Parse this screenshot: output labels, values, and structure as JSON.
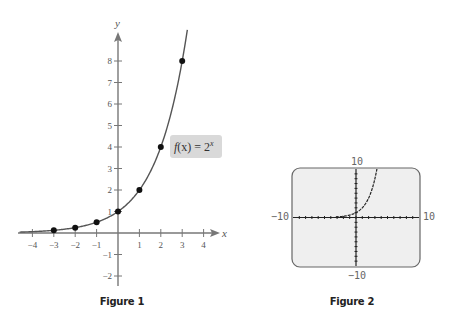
{
  "chart_data": [
    {
      "type": "line",
      "title": "",
      "caption": "Figure 1",
      "function": "2^x",
      "xlabel": "x",
      "ylabel": "y",
      "xlim": [
        -4.5,
        4.6
      ],
      "ylim": [
        -2.4,
        9.3
      ],
      "xticks": [
        -4,
        -3,
        -2,
        -1,
        1,
        2,
        3,
        4
      ],
      "yticks": [
        -2,
        -1,
        1,
        2,
        3,
        4,
        5,
        6,
        7,
        8
      ],
      "xtick_labels": [
        "−4",
        "−3",
        "−2",
        "−1",
        "1",
        "2",
        "3",
        "4"
      ],
      "ytick_labels": [
        "−2",
        "−1",
        "1",
        "2",
        "3",
        "4",
        "5",
        "6",
        "7",
        "8"
      ],
      "points": {
        "x": [
          -3,
          -2,
          -1,
          0,
          1,
          2,
          3
        ],
        "y": [
          0.125,
          0.25,
          0.5,
          1,
          2,
          4,
          8
        ]
      },
      "annotation": {
        "text_f": "f",
        "text_x": "(x) = 2",
        "text_exp": "x",
        "color": "#d9d9d9"
      },
      "grid": false
    },
    {
      "type": "line",
      "title": "",
      "caption": "Figure 2",
      "function": "2^x",
      "window": {
        "xmin": -10,
        "xmax": 10,
        "ymin": -10,
        "ymax": 10
      },
      "labels": {
        "top": "10",
        "bottom": "−10",
        "left": "−10",
        "right": "10"
      },
      "screen_color": "#efefef",
      "grid": false
    }
  ]
}
